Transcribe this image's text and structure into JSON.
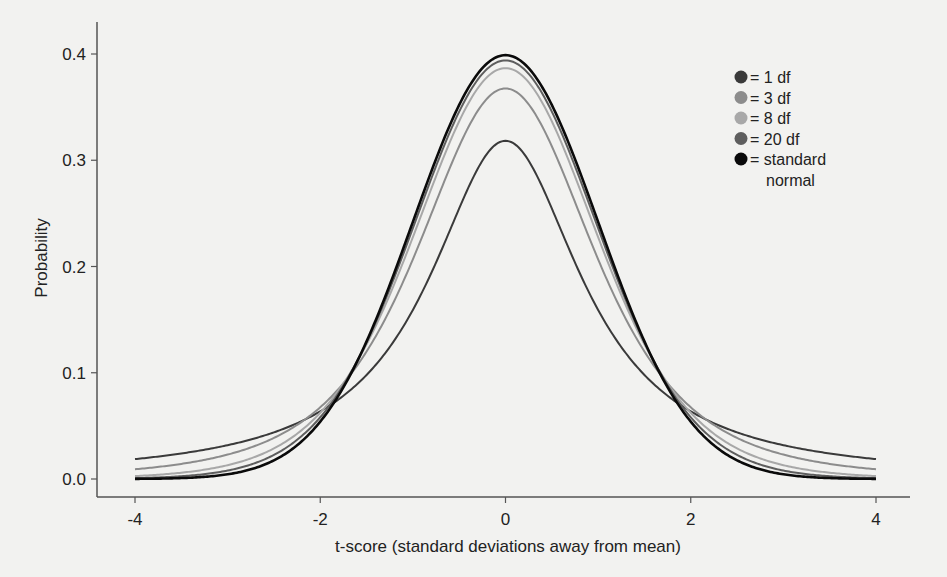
{
  "chart_data": {
    "type": "line",
    "title": "",
    "xlabel": "t-score (standard deviations away from mean)",
    "ylabel": "Probability",
    "xlim": [
      -4,
      4
    ],
    "ylim": [
      0.0,
      0.4
    ],
    "xticks": [
      -4,
      -2,
      0,
      2,
      4
    ],
    "xtick_labels": [
      "-4",
      "-2",
      "0",
      "2",
      "4"
    ],
    "yticks": [
      0.0,
      0.1,
      0.2,
      0.3,
      0.4
    ],
    "ytick_labels": [
      "0.0",
      "0.1",
      "0.2",
      "0.3",
      "0.4"
    ],
    "grid": false,
    "legend_position": "top-right",
    "series": [
      {
        "name": "1 df",
        "label": "= 1 df",
        "df": 1,
        "color": "#3a3a3a",
        "peak": 0.318
      },
      {
        "name": "3 df",
        "label": "= 3 df",
        "df": 3,
        "color": "#8c8c8c",
        "peak": 0.368
      },
      {
        "name": "8 df",
        "label": "= 8 df",
        "df": 8,
        "color": "#a8a8a8",
        "peak": 0.387
      },
      {
        "name": "20 df",
        "label": "= 20 df",
        "df": 20,
        "color": "#5e5e5e",
        "peak": 0.394
      },
      {
        "name": "standard normal",
        "label": "= standard",
        "label2": "normal",
        "df": null,
        "color": "#0a0a0a",
        "peak": 0.399
      }
    ],
    "sample_points": {
      "x": [
        -4,
        -3,
        -2,
        -1,
        0,
        1,
        2,
        3,
        4
      ],
      "1 df": [
        0.019,
        0.032,
        0.064,
        0.159,
        0.318,
        0.159,
        0.064,
        0.032,
        0.019
      ],
      "3 df": [
        0.009,
        0.023,
        0.068,
        0.207,
        0.368,
        0.207,
        0.068,
        0.023,
        0.009
      ],
      "8 df": [
        0.003,
        0.014,
        0.063,
        0.228,
        0.387,
        0.228,
        0.063,
        0.014,
        0.003
      ],
      "20 df": [
        0.001,
        0.008,
        0.058,
        0.237,
        0.394,
        0.237,
        0.058,
        0.008,
        0.001
      ],
      "standard normal": [
        0.0001,
        0.004,
        0.054,
        0.242,
        0.399,
        0.242,
        0.054,
        0.004,
        0.0001
      ]
    }
  }
}
